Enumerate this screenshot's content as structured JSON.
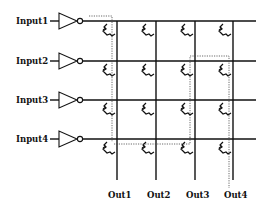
{
  "diagram": {
    "title": "",
    "inputs": [
      {
        "label": "Input1",
        "y": 21
      },
      {
        "label": "Input2",
        "y": 61
      },
      {
        "label": "Input3",
        "y": 100
      },
      {
        "label": "Input4",
        "y": 139
      }
    ],
    "outputs": [
      {
        "label": "Out1",
        "x": 117
      },
      {
        "label": "Out2",
        "x": 156
      },
      {
        "label": "Out3",
        "x": 195
      },
      {
        "label": "Out4",
        "x": 233
      }
    ],
    "icons": {
      "inverter": "inverter-icon",
      "crosspoint": "transistor-crosspoint-icon"
    },
    "highlighted_paths": [
      {
        "from": "Input1",
        "to": "Out1",
        "style": "dotted"
      },
      {
        "from": "Input4",
        "to": "Out3",
        "style": "dotted"
      },
      {
        "from": "Input2",
        "to": "Out4",
        "style": "dotted"
      }
    ],
    "colors": {
      "line": "#111111",
      "background": "#ffffff",
      "dotted": "#444444"
    }
  }
}
